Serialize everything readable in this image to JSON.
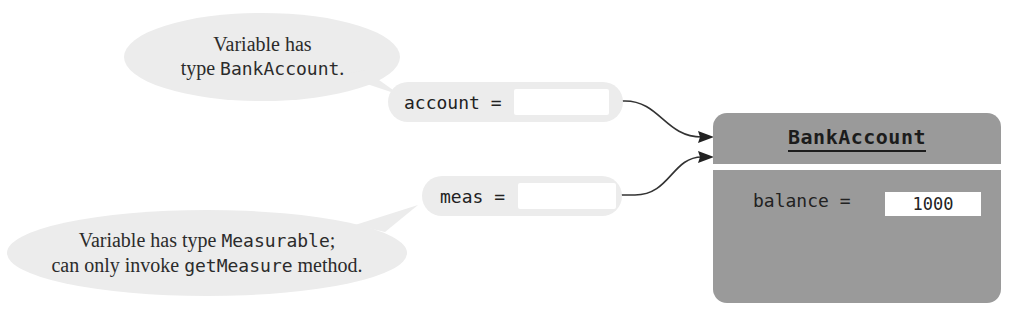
{
  "callouts": {
    "top": {
      "line1": "Variable has",
      "line2_prefix": "type ",
      "line2_code": "BankAccount",
      "line2_suffix": "."
    },
    "bottom": {
      "line1_prefix": "Variable has type ",
      "line1_code": "Measurable",
      "line1_suffix": ";",
      "line2_prefix": "can only invoke ",
      "line2_code": "getMeasure",
      "line2_suffix": " method."
    }
  },
  "variables": [
    {
      "label": "account =",
      "value": ""
    },
    {
      "label": "meas =",
      "value": ""
    }
  ],
  "object": {
    "class_name": "BankAccount",
    "fields": [
      {
        "label": "balance =",
        "value": "1000"
      }
    ]
  },
  "colors": {
    "bubble": "#ececec",
    "object_fill": "#9a9a9a",
    "arrow": "#333333",
    "text": "#222222"
  }
}
